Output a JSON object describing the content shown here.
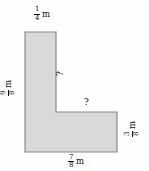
{
  "figure": {
    "type": "composite-rectilinear-shape",
    "shape_name": "L-shape",
    "fill_color": "#d9d9d9",
    "stroke_color": "#8a8a8a",
    "background_color": "#fefefe",
    "unit": "m"
  },
  "labels": {
    "top": {
      "numerator": "1",
      "denominator": "4",
      "unit": "m",
      "orientation": "horizontal",
      "side": "top-edge-of-vertical-arm"
    },
    "left": {
      "numerator": "9",
      "denominator": "8",
      "unit": "m",
      "orientation": "rotated-90",
      "side": "left-edge"
    },
    "bottom": {
      "numerator": "7",
      "denominator": "8",
      "unit": "m",
      "orientation": "horizontal",
      "side": "bottom-edge"
    },
    "right": {
      "numerator": "3",
      "denominator": "8",
      "unit": "m",
      "orientation": "rotated-90",
      "side": "right-edge"
    }
  },
  "unknowns": {
    "vertical": {
      "text": "?",
      "orientation": "rotated-90",
      "side": "inner-vertical-edge"
    },
    "horizontal": {
      "text": "?",
      "orientation": "horizontal",
      "side": "inner-horizontal-edge"
    }
  },
  "geometry": {
    "points": "25,32 56,32 56,112 117,112 117,152 25,152",
    "vertices": [
      [
        25,
        32
      ],
      [
        56,
        32
      ],
      [
        56,
        112
      ],
      [
        117,
        112
      ],
      [
        117,
        152
      ],
      [
        25,
        152
      ]
    ]
  }
}
